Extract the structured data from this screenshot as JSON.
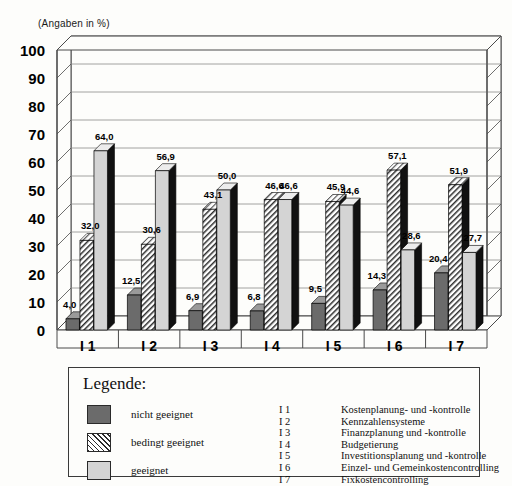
{
  "unit_note": "(Angaben in %)",
  "chart_data": {
    "type": "bar",
    "title": "",
    "subtitle": "",
    "xlabel": "",
    "ylabel": "",
    "unit_note": "(Angaben in %)",
    "ylim": [
      0,
      100
    ],
    "ytick_step": 10,
    "yticks": [
      "100",
      "90",
      "80",
      "70",
      "60",
      "50",
      "40",
      "30",
      "20",
      "10",
      "0"
    ],
    "grid": true,
    "three_d": true,
    "legend_position": "below-chart-box",
    "categories": [
      "I 1",
      "I 2",
      "I 3",
      "I 4",
      "I 5",
      "I 6",
      "I 7"
    ],
    "series": [
      {
        "name": "nicht geeignet",
        "fill": "#6b6b6b",
        "pattern": "solid-dark-gray",
        "values": [
          4.0,
          12.5,
          6.9,
          6.8,
          9.5,
          14.3,
          20.4
        ],
        "labels": [
          "4,0",
          "12,5",
          "6,9",
          "6,8",
          "9,5",
          "14,3",
          "20,4"
        ]
      },
      {
        "name": "bedingt geeignet",
        "fill": "#ffffff",
        "pattern": "diagonal-hatch",
        "values": [
          32.0,
          30.6,
          43.1,
          46.6,
          45.9,
          57.1,
          51.9
        ],
        "labels": [
          "32,0",
          "30,6",
          "43,1",
          "46,6",
          "45,9",
          "57,1",
          "51,9"
        ]
      },
      {
        "name": "geeignet",
        "fill": "#d4d4d4",
        "pattern": "solid-light-gray",
        "values": [
          64.0,
          56.9,
          50.0,
          46.6,
          44.6,
          28.6,
          27.7
        ],
        "labels": [
          "64,0",
          "56,9",
          "50,0",
          "46,6",
          "44,6",
          "28,6",
          "27,7"
        ]
      }
    ]
  },
  "legend": {
    "title": "Legende:",
    "swatches": [
      {
        "label": "nicht geeignet",
        "style": "sw-dark"
      },
      {
        "label": "bedingt geeignet",
        "style": "sw-hatch"
      },
      {
        "label": "geeignet",
        "style": "sw-light"
      }
    ],
    "codes": [
      "I 1",
      "I 2",
      "I 3",
      "I 4",
      "I 5",
      "I 6",
      "I 7"
    ],
    "names": [
      "Kostenplanung- und -kontrolle",
      "Kennzahlensysteme",
      "Finanzplanung und -kontrolle",
      "Budgetierung",
      "Investitionsplanung und -kontrolle",
      "Einzel- und Gemeinkostencontrolling",
      "Fixkostencontrolling"
    ]
  },
  "colors": {
    "background": "#fdfdfb",
    "axis": "#4a4a4a",
    "grid": "#8c8c8c",
    "bar_dark": "#6b6b6b",
    "bar_light": "#d4d4d4",
    "bar_side": "#111111",
    "text": "#111111"
  }
}
